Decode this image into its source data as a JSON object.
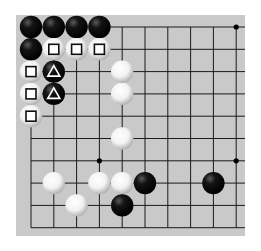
{
  "board": {
    "description": "Partial Go board (top-left corner region), 10x10 visible intersections",
    "background_color": "#c9c9c9",
    "line_color": "#1a1a1a",
    "columns_x": [
      31,
      53.8,
      76.6,
      99.4,
      122.2,
      145,
      167.8,
      190.6,
      213.4,
      236.2
    ],
    "rows_y": [
      27,
      49.3,
      71.6,
      93.9,
      116.2,
      138.5,
      160.8,
      183.1,
      205.4,
      227.7
    ],
    "star_points": [
      [
        9,
        0
      ],
      [
        3,
        6
      ],
      [
        9,
        6
      ]
    ],
    "stones": [
      {
        "color": "black",
        "col": 0,
        "row": 0,
        "mark": null
      },
      {
        "color": "black",
        "col": 1,
        "row": 0,
        "mark": null
      },
      {
        "color": "black",
        "col": 2,
        "row": 0,
        "mark": null
      },
      {
        "color": "black",
        "col": 3,
        "row": 0,
        "mark": null
      },
      {
        "color": "black",
        "col": 0,
        "row": 1,
        "mark": null
      },
      {
        "color": "white",
        "col": 1,
        "row": 1,
        "mark": "square"
      },
      {
        "color": "white",
        "col": 2,
        "row": 1,
        "mark": "square"
      },
      {
        "color": "white",
        "col": 3,
        "row": 1,
        "mark": "square"
      },
      {
        "color": "white",
        "col": 0,
        "row": 2,
        "mark": "square"
      },
      {
        "color": "black",
        "col": 1,
        "row": 2,
        "mark": "triangle"
      },
      {
        "color": "white",
        "col": 0,
        "row": 3,
        "mark": "square"
      },
      {
        "color": "black",
        "col": 1,
        "row": 3,
        "mark": "triangle"
      },
      {
        "color": "white",
        "col": 0,
        "row": 4,
        "mark": "square"
      },
      {
        "color": "white",
        "col": 4,
        "row": 2,
        "mark": null
      },
      {
        "color": "white",
        "col": 4,
        "row": 3,
        "mark": null
      },
      {
        "color": "white",
        "col": 4,
        "row": 5,
        "mark": null
      },
      {
        "color": "white",
        "col": 1,
        "row": 7,
        "mark": null
      },
      {
        "color": "white",
        "col": 3,
        "row": 7,
        "mark": null
      },
      {
        "color": "white",
        "col": 4,
        "row": 7,
        "mark": null
      },
      {
        "color": "black",
        "col": 5,
        "row": 7,
        "mark": null
      },
      {
        "color": "black",
        "col": 8,
        "row": 7,
        "mark": null
      },
      {
        "color": "white",
        "col": 2,
        "row": 8,
        "mark": null
      },
      {
        "color": "black",
        "col": 4,
        "row": 8,
        "mark": null
      }
    ]
  }
}
